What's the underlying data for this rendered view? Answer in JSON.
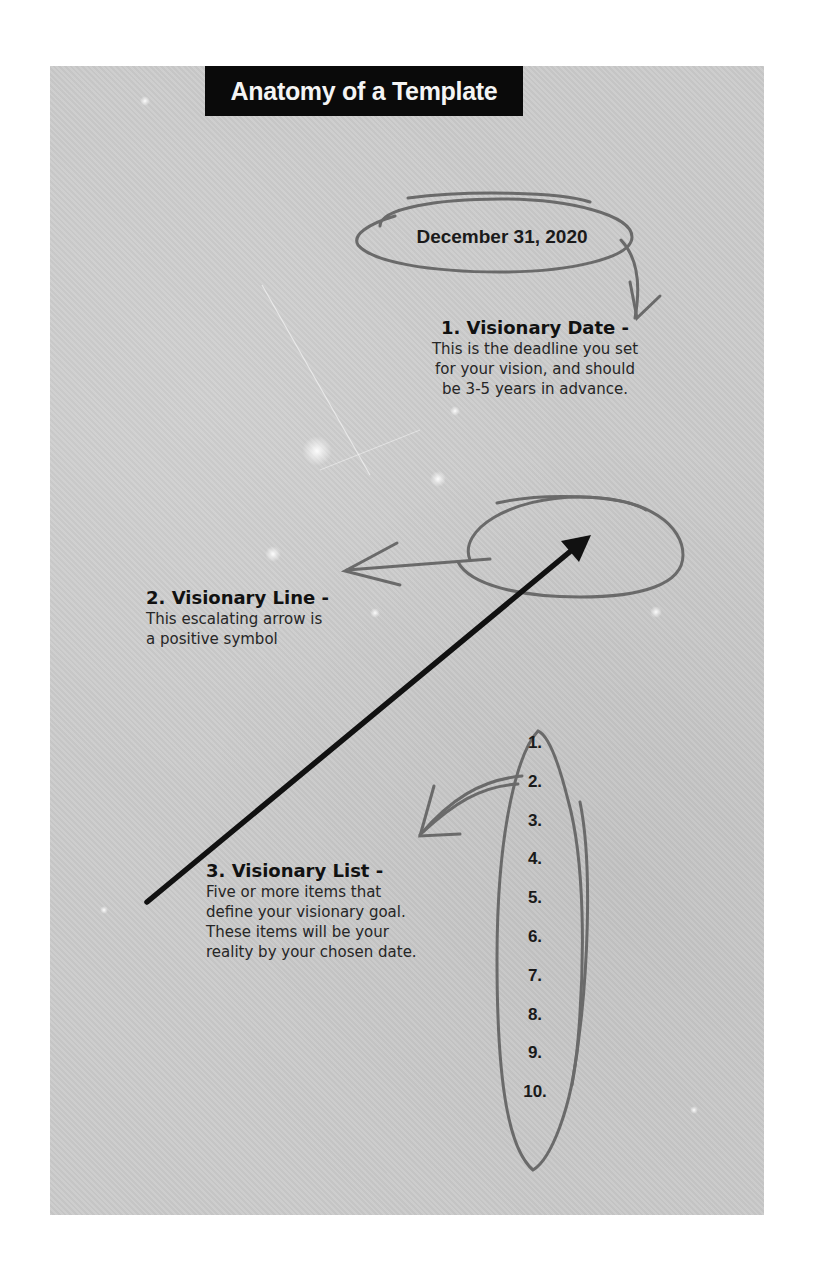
{
  "title": "Anatomy of a Template",
  "date": {
    "value": "December 31, 2020"
  },
  "sections": [
    {
      "heading": "1. Visionary Date -",
      "body": [
        "This is the deadline you set",
        "for your vision, and should",
        "be 3-5 years in advance."
      ]
    },
    {
      "heading": "2. Visionary Line -",
      "body": [
        "This escalating arrow is",
        "a positive symbol"
      ]
    },
    {
      "heading": "3. Visionary List -",
      "body": [
        "Five or more items that",
        "define your visionary goal.",
        "These items will be your",
        "reality by your chosen date."
      ]
    }
  ],
  "list_numbers": [
    "1.",
    "2.",
    "3.",
    "4.",
    "5.",
    "6.",
    "7.",
    "8.",
    "9.",
    "10."
  ],
  "colors": {
    "background": "#cbcbcb",
    "title_bar": "#0a0a0a",
    "title_text": "#f4f4f4",
    "annotation_stroke": "#6a6a6a",
    "arrow_stroke": "#111111"
  },
  "icons": {
    "date_ellipse": "hand-drawn-ellipse",
    "line_ellipse": "hand-drawn-ellipse",
    "list_ellipse": "hand-drawn-ellipse",
    "visionary_line": "diagonal-up-arrow"
  }
}
